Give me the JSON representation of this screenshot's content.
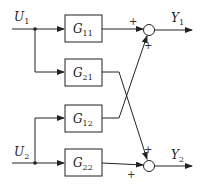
{
  "diagram": {
    "type": "block-diagram",
    "inputs": [
      {
        "name": "U",
        "sub": "1"
      },
      {
        "name": "U",
        "sub": "2"
      }
    ],
    "outputs": [
      {
        "name": "Y",
        "sub": "1"
      },
      {
        "name": "Y",
        "sub": "2"
      }
    ],
    "blocks": [
      {
        "name": "G",
        "sub": "11"
      },
      {
        "name": "G",
        "sub": "21"
      },
      {
        "name": "G",
        "sub": "12"
      },
      {
        "name": "G",
        "sub": "22"
      }
    ],
    "signs": {
      "sum1_top": "+",
      "sum1_bottom": "+",
      "sum2_top": "+",
      "sum2_bottom": "+"
    },
    "colors": {
      "line": "#222222",
      "background": "#ffffff"
    }
  }
}
